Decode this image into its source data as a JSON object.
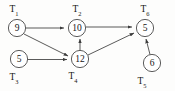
{
  "diagram": {
    "type": "directed-task-graph",
    "title": "",
    "nodes": [
      {
        "id": "T1",
        "label": "T",
        "sub": "1",
        "value": "9",
        "cx": 17,
        "cy": 28,
        "r": 8.6,
        "label_x": 14,
        "label_y": 12
      },
      {
        "id": "T2",
        "label": "T",
        "sub": "2",
        "value": "10",
        "cx": 77,
        "cy": 28,
        "r": 8.6,
        "label_x": 77,
        "label_y": 12
      },
      {
        "id": "T6",
        "label": "T",
        "sub": "6",
        "value": "5",
        "cx": 145,
        "cy": 28,
        "r": 8.6,
        "label_x": 145,
        "label_y": 12
      },
      {
        "id": "T3",
        "label": "T",
        "sub": "3",
        "value": "5",
        "cx": 19,
        "cy": 59,
        "r": 8.6,
        "label_x": 14,
        "label_y": 80
      },
      {
        "id": "T4",
        "label": "T",
        "sub": "4",
        "value": "12",
        "cx": 80,
        "cy": 59,
        "r": 8.6,
        "label_x": 73,
        "label_y": 79
      },
      {
        "id": "T5",
        "label": "T",
        "sub": "5",
        "value": "6",
        "cx": 152,
        "cy": 63,
        "r": 8.6,
        "label_x": 142,
        "label_y": 84
      }
    ],
    "edges": [
      {
        "id": "e1",
        "from": "T1",
        "to": "T2",
        "path": "M 26.0 28.0 L 64.0 28.0"
      },
      {
        "id": "e2",
        "from": "T1",
        "to": "T4",
        "path": "M 24.0 34.0 L 68.0 56.0"
      },
      {
        "id": "e3",
        "from": "T3",
        "to": "T4",
        "path": "M 28.0 59.5 L 67.0 59.5"
      },
      {
        "id": "e4",
        "from": "T4",
        "to": "T2",
        "path": "M 80.0 50.5 L 80.0 39.0"
      },
      {
        "id": "e5",
        "from": "T2",
        "to": "T6",
        "path": "M 86.0 27.0 L 132.0 27.0"
      },
      {
        "id": "e6",
        "from": "T4",
        "to": "T6",
        "path": "M 88.0 55.0 L 134.0 33.0"
      },
      {
        "id": "e7",
        "from": "T5",
        "to": "T6",
        "path": "M 150.0 54.5 L 146.0 39.0"
      }
    ],
    "arrowhead": {
      "name": "arrowhead-marker",
      "color": "#3c3c3c"
    }
  }
}
